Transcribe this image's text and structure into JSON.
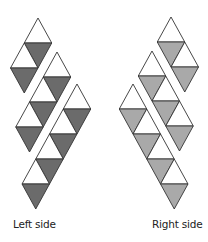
{
  "figure": {
    "width": 208,
    "height": 242,
    "triangle_side": 27.5,
    "row_height": 25,
    "colors": {
      "stroke": "#333333",
      "white_fill": "#ffffff",
      "left_shade": "#6b6b6b",
      "right_shade": "#a9a9a9"
    }
  },
  "panels": [
    {
      "id": "left",
      "label": "Left side",
      "direction": "left",
      "shade_key": "left_shade",
      "strips": [
        {
          "name": "strip-1",
          "apex": [
            38,
            18
          ],
          "pairs": 2
        },
        {
          "name": "strip-2",
          "apex": [
            57,
            52
          ],
          "pairs": 3
        },
        {
          "name": "strip-3",
          "apex": [
            77,
            84
          ],
          "pairs": 4
        }
      ]
    },
    {
      "id": "right",
      "label": "Right side",
      "direction": "right",
      "shade_key": "right_shade",
      "strips": [
        {
          "name": "strip-1",
          "apex": [
            171,
            17
          ],
          "pairs": 2
        },
        {
          "name": "strip-2",
          "apex": [
            152,
            51
          ],
          "pairs": 3
        },
        {
          "name": "strip-3",
          "apex": [
            133,
            84
          ],
          "pairs": 4
        }
      ]
    }
  ]
}
